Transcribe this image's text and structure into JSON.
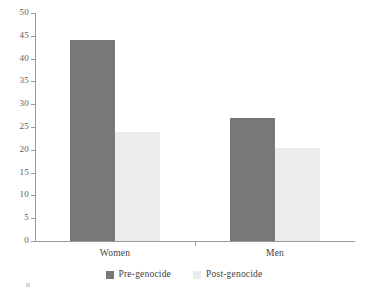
{
  "chart_data": {
    "type": "bar",
    "title": "",
    "subtitle": "",
    "xlabel": "",
    "ylabel": "",
    "categories": [
      "Women",
      "Men"
    ],
    "series": [
      {
        "name": "Pre-genocide",
        "values": [
          44,
          27
        ],
        "color": "#787878"
      },
      {
        "name": "Post-genocide",
        "values": [
          24,
          20.5
        ],
        "color": "#ececec"
      }
    ],
    "ylim": [
      0,
      50
    ],
    "ytick_step": 5,
    "yticks": [
      0,
      5,
      10,
      15,
      20,
      25,
      30,
      35,
      40,
      45,
      50
    ],
    "ytick_labels": [
      "0",
      "5",
      "10",
      "15",
      "20",
      "25",
      "30",
      "35",
      "40",
      "45",
      "50"
    ],
    "grid": false,
    "legend_position": "bottom",
    "annotations": []
  },
  "legend": {
    "items": [
      {
        "label": "Pre-genocide",
        "swatch": "pre"
      },
      {
        "label": "Post-genocide",
        "swatch": "post"
      }
    ]
  },
  "axis": {
    "line_color": "#9a9a9a",
    "tick_color": "#9a9a9a",
    "label_color": "#5b5b5b"
  }
}
